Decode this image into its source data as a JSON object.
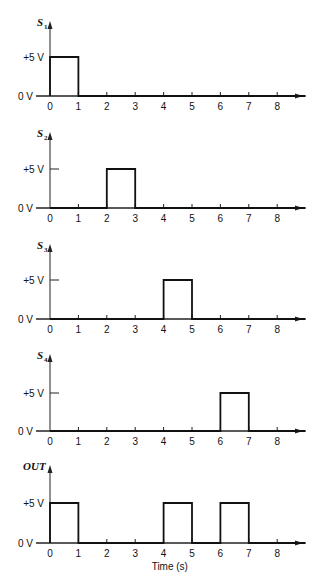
{
  "chart_data": {
    "type": "line",
    "title": "",
    "xlabel": "Time (s)",
    "ylabel": "",
    "x_ticks": [
      "0",
      "1",
      "2",
      "3",
      "4",
      "5",
      "6",
      "7",
      "8"
    ],
    "y_ticks": [
      "0 V",
      "+5 V"
    ],
    "xlim": [
      0,
      9
    ],
    "ylim": [
      0,
      5
    ],
    "grid": false,
    "series": [
      {
        "name": "S1",
        "label_main": "S",
        "label_sub": "1",
        "pulses": [
          [
            0,
            1
          ]
        ],
        "x": [
          0,
          0,
          1,
          1,
          9
        ],
        "values": [
          0,
          5,
          5,
          0,
          0
        ]
      },
      {
        "name": "S2",
        "label_main": "S",
        "label_sub": "2",
        "pulses": [
          [
            2,
            3
          ]
        ],
        "x": [
          0,
          2,
          2,
          3,
          3,
          9
        ],
        "values": [
          0,
          0,
          5,
          5,
          0,
          0
        ]
      },
      {
        "name": "S3",
        "label_main": "S",
        "label_sub": "3",
        "pulses": [
          [
            4,
            5
          ]
        ],
        "x": [
          0,
          4,
          4,
          5,
          5,
          9
        ],
        "values": [
          0,
          0,
          5,
          5,
          0,
          0
        ]
      },
      {
        "name": "S4",
        "label_main": "S",
        "label_sub": "4",
        "pulses": [
          [
            6,
            7
          ]
        ],
        "x": [
          0,
          6,
          6,
          7,
          7,
          9
        ],
        "values": [
          0,
          0,
          5,
          5,
          0,
          0
        ]
      },
      {
        "name": "OUT",
        "label_main": "OUT",
        "label_sub": "",
        "pulses": [
          [
            0,
            1
          ],
          [
            4,
            5
          ],
          [
            6,
            7
          ]
        ],
        "x": [
          0,
          0,
          1,
          1,
          4,
          4,
          5,
          5,
          6,
          6,
          7,
          7,
          9
        ],
        "values": [
          0,
          5,
          5,
          0,
          0,
          5,
          5,
          0,
          0,
          5,
          5,
          0,
          0
        ]
      }
    ]
  }
}
